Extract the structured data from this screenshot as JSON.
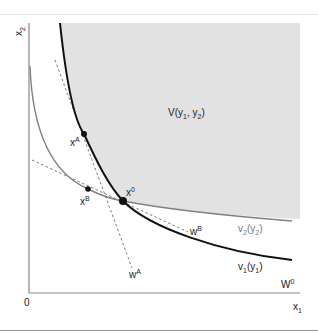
{
  "figure": {
    "axes": {
      "x_label": "x",
      "x_label_sub": "1",
      "y_label": "x",
      "y_label_sub": "2",
      "origin_label": "0"
    },
    "region": {
      "label_main": "V(y",
      "label_sub1": "1",
      "label_mid": ", y",
      "label_sub2": "2",
      "label_end": ")",
      "fill_color": "#e2e2e2"
    },
    "curves": {
      "v1": {
        "name": "v",
        "sub": "1",
        "arg": "(y",
        "arg_sub": "1",
        "arg_end": ")",
        "color": "#111111"
      },
      "v2": {
        "name": "v",
        "sub": "2",
        "arg": "(y",
        "arg_sub": "2",
        "arg_end": ")",
        "color": "#808080"
      }
    },
    "lines": {
      "wA": {
        "name": "w",
        "sup": "A"
      },
      "wB": {
        "name": "w",
        "sup": "B"
      },
      "w0": {
        "name": "W",
        "sup": "0"
      }
    },
    "points": {
      "xA": {
        "name": "x",
        "sup": "A"
      },
      "xB": {
        "name": "x",
        "sup": "B"
      },
      "x0": {
        "name": "x",
        "sup": "0"
      }
    }
  }
}
